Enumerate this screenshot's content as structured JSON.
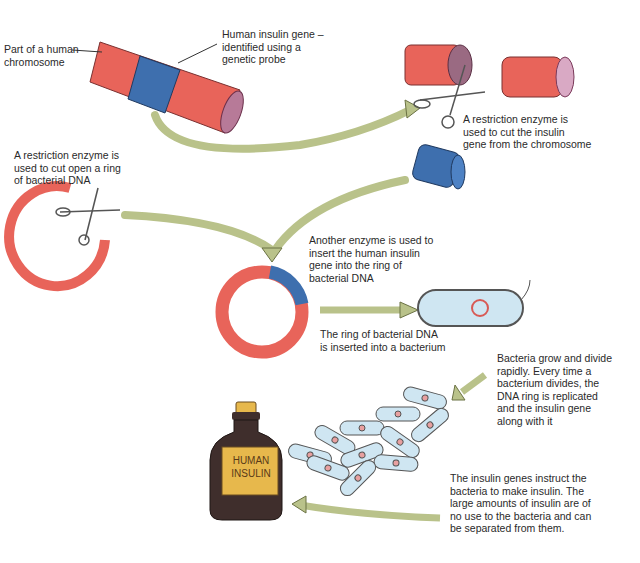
{
  "labels": {
    "chromosome": "Part of a human\nchromosome",
    "insulin_gene": "Human insulin gene –\nidentified using a\ngenetic probe",
    "cut_gene": "A restriction enzyme is\nused to cut the insulin\ngene from the chromosome",
    "cut_ring": "A restriction enzyme is\nused to cut open a ring\nof bacterial DNA",
    "insert_gene": "Another enzyme is used to\ninsert the human insulin\ngene into the ring of\nbacterial DNA",
    "insert_ring": "The ring of bacterial DNA\nis inserted into a bacterium",
    "divide": "Bacteria grow and divide\nrapidly. Every time a\nbacterium divides, the\nDNA ring is replicated\nand the insulin gene\nalong with it",
    "make_insulin": "The insulin genes instruct the\nbacteria to make insulin. The\nlarge amounts of insulin are of\nno use to the bacteria and can\nbe separated from them.",
    "bottle": "HUMAN\nINSULIN"
  },
  "colors": {
    "dna_red": "#e8645a",
    "gene_blue": "#3e6fae",
    "arrow_green": "#b9c28a",
    "bacterium_fill": "#cfe6f2",
    "bottle_brown": "#3f2e2c",
    "label_yellow": "#e7b84c"
  }
}
